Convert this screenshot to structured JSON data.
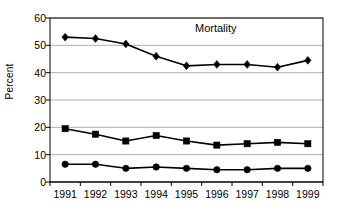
{
  "chart_data": {
    "type": "line",
    "title": "Mortality",
    "xlabel": "",
    "ylabel": "Percent",
    "categories": [
      "1991",
      "1992",
      "1993",
      "1994",
      "1995",
      "1996",
      "1997",
      "1998",
      "1999"
    ],
    "ylim": [
      0,
      60
    ],
    "y_ticks": [
      0,
      10,
      20,
      30,
      40,
      50,
      60
    ],
    "y_tick_labels": [
      "0",
      "10",
      "20",
      "30",
      "40",
      "50",
      "60"
    ],
    "grid": "horizontal",
    "legend": "none",
    "series": [
      {
        "name": "series-diamond",
        "marker": "diamond",
        "color": "#000000",
        "values": [
          53,
          52.5,
          50.5,
          46,
          42.5,
          43,
          43,
          42,
          44.5
        ]
      },
      {
        "name": "series-square",
        "marker": "square",
        "color": "#000000",
        "values": [
          19.5,
          17.5,
          15,
          17,
          15,
          13.5,
          14,
          14.5,
          14
        ]
      },
      {
        "name": "series-circle",
        "marker": "circle",
        "color": "#000000",
        "values": [
          6.5,
          6.5,
          5,
          5.5,
          5,
          4.5,
          4.5,
          5,
          5
        ]
      }
    ],
    "style": {
      "plot_border_color": "#000000",
      "gridline_color": "#a6a6a6",
      "background": "#ffffff",
      "line_width": 1.6,
      "marker_size": 5
    },
    "plot_box": {
      "left": 50,
      "top": 18,
      "right": 323,
      "bottom": 182
    }
  }
}
